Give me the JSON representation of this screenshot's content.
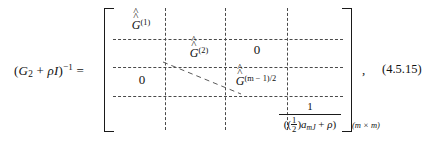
{
  "equation": {
    "lhs": {
      "open_paren": "(",
      "matrix_symbol": "G",
      "matrix_subscript": "2",
      "plus": " + ",
      "rho": "ρ",
      "identity": "I",
      "close_paren": ")",
      "exponent": "−1",
      "equals": "="
    },
    "matrix": {
      "bracket_open": "[",
      "bracket_close": "]",
      "dimension_label": "(m × m)",
      "diagonal_blocks": [
        {
          "base": "G",
          "accent": "double-hat",
          "superscript": "(1)"
        },
        {
          "base": "G",
          "accent": "double-hat",
          "superscript": "(2)"
        },
        {
          "base": "G",
          "accent": "double-hat",
          "superscript": "(m − 1)/2"
        }
      ],
      "zeros": [
        {
          "label": "0",
          "position": "upper-right"
        },
        {
          "label": "0",
          "position": "lower-left"
        }
      ],
      "scalar_entry": {
        "numerator": "1",
        "denominator": {
          "open_paren": "(",
          "coefficient_numerator": "1",
          "coefficient_denominator": "2",
          "coefficient_close": ")",
          "variable": "a",
          "variable_subscript": "mJ",
          "plus": " + ",
          "rho": "ρ",
          "close_paren": ")"
        }
      },
      "ellipsis_style": "diagonal-dashed"
    },
    "trailing_comma": ",",
    "number": "(4.5.15)"
  }
}
